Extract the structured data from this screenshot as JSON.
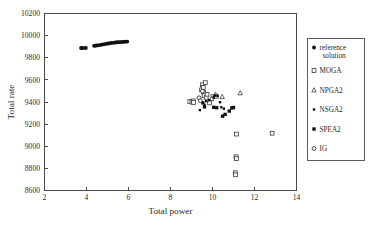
{
  "chart_data": {
    "type": "scatter",
    "title": "",
    "xlabel": "Total power",
    "ylabel": "Total rate",
    "xlim": [
      2,
      14
    ],
    "ylim": [
      8600,
      10200
    ],
    "xticks": [
      2,
      4,
      6,
      8,
      10,
      12,
      14
    ],
    "yticks": [
      8600,
      8800,
      9000,
      9200,
      9400,
      9600,
      9800,
      10000,
      10200
    ],
    "grid": false,
    "legend_position": "right-outside",
    "series": [
      {
        "name": "reference solution",
        "marker": "filled-circle",
        "color": "#111111",
        "points": [
          [
            3.74,
            9888
          ],
          [
            3.8,
            9888
          ],
          [
            3.92,
            9889
          ],
          [
            3.97,
            9889
          ],
          [
            4.36,
            9908
          ],
          [
            4.42,
            9909
          ],
          [
            4.48,
            9911
          ],
          [
            4.55,
            9912
          ],
          [
            4.63,
            9915
          ],
          [
            4.72,
            9918
          ],
          [
            4.8,
            9921
          ],
          [
            4.88,
            9924
          ],
          [
            4.96,
            9927
          ],
          [
            5.04,
            9929
          ],
          [
            5.12,
            9932
          ],
          [
            5.2,
            9934
          ],
          [
            5.3,
            9936
          ],
          [
            5.38,
            9938
          ],
          [
            5.46,
            9940
          ],
          [
            5.54,
            9941
          ],
          [
            5.62,
            9942
          ],
          [
            5.7,
            9943
          ],
          [
            5.78,
            9944
          ],
          [
            5.86,
            9945
          ],
          [
            5.94,
            9946
          ]
        ]
      },
      {
        "name": "MOGA",
        "marker": "open-square",
        "color": "#3a3a3a",
        "points": [
          [
            8.92,
            9404
          ],
          [
            9.02,
            9399
          ],
          [
            9.08,
            9410
          ],
          [
            9.1,
            9396
          ],
          [
            9.48,
            9510
          ],
          [
            9.52,
            9556
          ],
          [
            9.56,
            9532
          ],
          [
            9.58,
            9487
          ],
          [
            9.6,
            9458
          ],
          [
            9.66,
            9575
          ],
          [
            9.7,
            9442
          ],
          [
            9.74,
            9470
          ],
          [
            9.86,
            9392
          ],
          [
            10.02,
            9448
          ],
          [
            10.18,
            9452
          ],
          [
            11.14,
            9110
          ],
          [
            11.12,
            8905
          ],
          [
            11.14,
            8888
          ],
          [
            11.08,
            8760
          ],
          [
            11.1,
            8742
          ],
          [
            12.84,
            9118
          ]
        ]
      },
      {
        "name": "NPGA2",
        "marker": "open-triangle",
        "color": "#3a3a3a",
        "points": [
          [
            10.14,
            9470
          ],
          [
            11.32,
            9482
          ],
          [
            10.46,
            9448
          ],
          [
            9.96,
            9430
          ]
        ]
      },
      {
        "name": "NSGA2",
        "marker": "small-filled-square",
        "color": "#222222",
        "points": [
          [
            9.4,
            9327
          ],
          [
            9.62,
            9374
          ],
          [
            9.7,
            9408
          ],
          [
            9.84,
            9418
          ],
          [
            10.06,
            9444
          ],
          [
            10.12,
            9460
          ],
          [
            10.24,
            9455
          ],
          [
            10.36,
            9398
          ],
          [
            10.42,
            9352
          ],
          [
            10.54,
            9340
          ]
        ]
      },
      {
        "name": "SPEA2",
        "marker": "filled-square",
        "color": "#111111",
        "points": [
          [
            9.54,
            9392
          ],
          [
            9.62,
            9356
          ],
          [
            10.06,
            9352
          ],
          [
            10.2,
            9348
          ],
          [
            10.48,
            9272
          ],
          [
            10.6,
            9288
          ],
          [
            10.8,
            9318
          ],
          [
            10.92,
            9346
          ],
          [
            11.0,
            9350
          ]
        ]
      },
      {
        "name": "IG",
        "marker": "open-circle",
        "color": "#2a2a2a",
        "points": [
          [
            9.36,
            9438
          ],
          [
            9.52,
            9498
          ],
          [
            9.42,
            9412
          ]
        ]
      }
    ]
  },
  "legend": {
    "items": [
      {
        "label": "reference",
        "label2": "solution",
        "marker": "filled-circle"
      },
      {
        "label": "MOGA",
        "label2": "",
        "marker": "open-square"
      },
      {
        "label": "NPGA2",
        "label2": "",
        "marker": "open-triangle"
      },
      {
        "label": "NSGA2",
        "label2": "",
        "marker": "small-filled-square"
      },
      {
        "label": "SPEA2",
        "label2": "",
        "marker": "filled-square"
      },
      {
        "label": "IG",
        "label2": "",
        "marker": "open-circle"
      }
    ]
  },
  "axes": {
    "x_title": "Total power",
    "y_title": "Total rate",
    "x_tick_labels": [
      "2",
      "4",
      "6",
      "8",
      "10",
      "12",
      "14"
    ],
    "y_tick_labels": [
      "8600",
      "8800",
      "9000",
      "9200",
      "9400",
      "9600",
      "9800",
      "10000",
      "10200"
    ]
  }
}
